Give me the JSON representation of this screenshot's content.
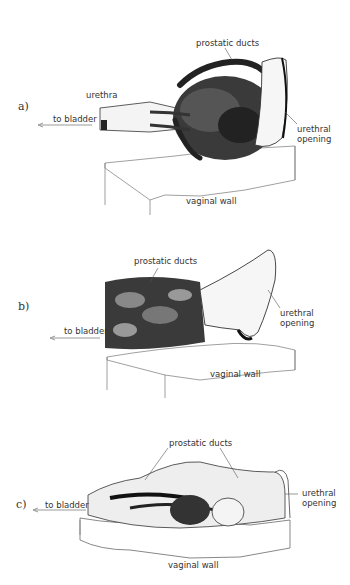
{
  "figure": {
    "panels": [
      {
        "id": "a",
        "panel_label": "a)",
        "labels": {
          "prostatic_ducts": "prostatic ducts",
          "urethra": "urethra",
          "to_bladder": "to bladder",
          "urethral_opening_1": "urethral",
          "urethral_opening_2": "opening",
          "vaginal_wall": "vaginal wall"
        }
      },
      {
        "id": "b",
        "panel_label": "b)",
        "labels": {
          "prostatic_ducts": "prostatic ducts",
          "to_bladder": "to bladder",
          "urethral_opening_1": "urethral",
          "urethral_opening_2": "opening",
          "vaginal_wall": "vaginal wall"
        }
      },
      {
        "id": "c",
        "panel_label": "c)",
        "labels": {
          "prostatic_ducts": "prostatic ducts",
          "to_bladder": "to bladder",
          "urethral_opening_1": "urethral",
          "urethral_opening_2": "opening",
          "vaginal_wall": "vaginal wall"
        }
      }
    ],
    "colors": {
      "ink": "#1a1a1a",
      "line": "#555555",
      "background": "#ffffff"
    }
  }
}
